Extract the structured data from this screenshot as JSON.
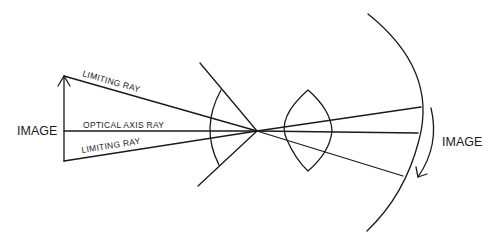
{
  "diagram": {
    "labels": {
      "image_left": "IMAGE",
      "limiting_ray_top": "LIMITING RAY",
      "optical_axis_ray": "OPTICAL AXIS RAY",
      "limiting_ray_bottom": "LIMITING RAY",
      "image_right": "IMAGE"
    },
    "colors": {
      "stroke": "#1a1a1a",
      "background": "#ffffff"
    }
  }
}
